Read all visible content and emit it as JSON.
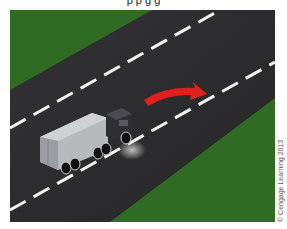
{
  "caption": {
    "top_text": "p p g g"
  },
  "illustration": {
    "subject": "Truck changing lanes to the right on a divided highway",
    "colors": {
      "grass": "#2f6b22",
      "road": "#2b2b2d",
      "lane_marking": "#f2f2f2",
      "arrow": "#e0201c",
      "trailer": "#b9bcbf",
      "cab": "#2e2e33"
    },
    "icons": {
      "arrow": "curved-right-arrow-icon",
      "vehicle": "truck-icon"
    }
  },
  "credit": {
    "text": "© Cengage Learning 2013"
  }
}
